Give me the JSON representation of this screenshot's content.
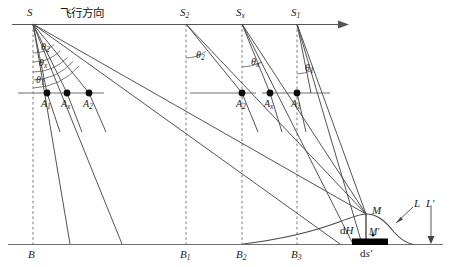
{
  "figure": {
    "type": "technical-diagram",
    "title_text": "飞行方向"
  },
  "flight_line": {
    "label_direction": "飞行方向",
    "arrow_direction": "right",
    "sensors": [
      {
        "id": "S",
        "base": "S",
        "sub": "",
        "x": 33,
        "y": 22
      },
      {
        "id": "S2",
        "base": "S",
        "sub": "2",
        "x": 186,
        "y": 22
      },
      {
        "id": "Sx",
        "base": "S",
        "sub": "x",
        "x": 242,
        "y": 22
      },
      {
        "id": "S1",
        "base": "S",
        "sub": "1",
        "x": 297,
        "y": 22
      }
    ]
  },
  "angles": [
    {
      "id": "theta2-left",
      "base": "θ",
      "sub": "2",
      "at": "S",
      "x": 41,
      "y": 47
    },
    {
      "id": "thetax-left",
      "base": "θ",
      "sub": "x",
      "x": 39,
      "y": 63
    },
    {
      "id": "theta1-left",
      "base": "θ",
      "sub": "1",
      "x": 36,
      "y": 80
    },
    {
      "id": "theta2-S2",
      "base": "θ",
      "sub": "2",
      "at": "S2",
      "x": 196,
      "y": 55
    },
    {
      "id": "thetax-Sx",
      "base": "θ",
      "sub": "x",
      "at": "Sx",
      "x": 251,
      "y": 62
    },
    {
      "id": "theta1-S1",
      "base": "θ",
      "sub": "1",
      "at": "S1",
      "x": 305,
      "y": 68
    }
  ],
  "ground_points": [
    {
      "id": "A1-left",
      "base": "A",
      "sub": "1",
      "px": 47,
      "py": 93,
      "lx": 43,
      "ly": 99
    },
    {
      "id": "Ax-left",
      "base": "A",
      "sub": "x",
      "px": 67,
      "py": 93,
      "lx": 63,
      "ly": 99
    },
    {
      "id": "A2-left",
      "base": "A",
      "sub": "2",
      "px": 89,
      "py": 93,
      "lx": 85,
      "ly": 99
    },
    {
      "id": "A2-right",
      "base": "A",
      "sub": "2",
      "px": 242,
      "py": 93,
      "lx": 238,
      "ly": 99
    },
    {
      "id": "Ax-right",
      "base": "A",
      "sub": "x",
      "px": 270,
      "py": 93,
      "lx": 266,
      "ly": 99
    },
    {
      "id": "A1-right",
      "base": "A",
      "sub": "1",
      "px": 297,
      "py": 93,
      "lx": 293,
      "ly": 99
    }
  ],
  "base_points": [
    {
      "id": "B",
      "base": "B",
      "sub": "",
      "x": 33,
      "y": 252
    },
    {
      "id": "B1",
      "base": "B",
      "sub": "1",
      "x": 186,
      "y": 252
    },
    {
      "id": "B2",
      "base": "B",
      "sub": "2",
      "x": 242,
      "y": 252
    },
    {
      "id": "B3",
      "base": "B",
      "sub": "3",
      "x": 297,
      "y": 252
    }
  ],
  "terrain": {
    "peak_label": "M",
    "peak_x": 366,
    "peak_y": 214,
    "foot_label": "M'",
    "height_label": "dH",
    "element_label": "ds'",
    "curve_label": "L",
    "datum_label": "L'"
  },
  "labels": {
    "M": "M",
    "M_prime": "M′",
    "dH_d": "d",
    "dH_H": "H",
    "ds_d": "d",
    "ds_s": "s′",
    "L": "L",
    "L_prime": "L′"
  },
  "colors": {
    "line": "#4a4a4a",
    "dashed": "#6b6b6b",
    "text": "#1a1a1a",
    "bar": "#000000",
    "background": "#ffffff"
  }
}
